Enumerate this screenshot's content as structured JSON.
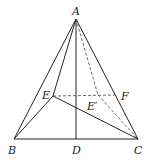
{
  "diagram": {
    "type": "geometry",
    "points": {
      "A": {
        "label": "A",
        "x": 76,
        "y": 19
      },
      "B": {
        "label": "B",
        "x": 14,
        "y": 139
      },
      "C": {
        "label": "C",
        "x": 138,
        "y": 139
      },
      "D": {
        "label": "D",
        "x": 76,
        "y": 139
      },
      "E": {
        "label": "E",
        "x": 53,
        "y": 96
      },
      "E_prime": {
        "label": "E′",
        "x": 98,
        "y": 95
      },
      "F": {
        "label": "F",
        "x": 116,
        "y": 95
      }
    },
    "solid_segments": [
      "AB",
      "AC",
      "BC",
      "AD",
      "AE",
      "BE",
      "EC"
    ],
    "dashed_segments": [
      "EF",
      "AE′",
      "E′C"
    ]
  }
}
